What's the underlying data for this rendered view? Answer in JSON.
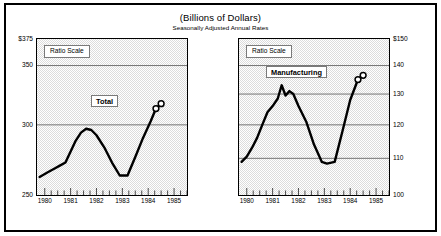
{
  "header": {
    "title": "(Billions of Dollars)",
    "subtitle": "Seasonally Adjusted Annual Rates"
  },
  "colors": {
    "frame": "#000000",
    "plot_background": "#dcdcdc",
    "gridline": "#555555",
    "series_line": "#000000",
    "label_box": "#ffffff"
  },
  "panels": {
    "left": {
      "scale_note": "Ratio Scale",
      "series_label": "Total",
      "y_ticks": [
        "$375",
        "350",
        "300",
        "250"
      ],
      "x_ticks": [
        "1980",
        "1981",
        "1982",
        "1983",
        "1984",
        "1985"
      ]
    },
    "right": {
      "scale_note": "Ratio Scale",
      "series_label": "Manufacturing",
      "y_ticks": [
        "$150",
        "140",
        "130",
        "120",
        "110",
        "100"
      ],
      "x_ticks": [
        "1980",
        "1981",
        "1982",
        "1983",
        "1984",
        "1985"
      ]
    }
  },
  "chart_data": [
    {
      "type": "line",
      "title": "(Billions of Dollars)",
      "subtitle": "Seasonally Adjusted Annual Rates",
      "name": "Total",
      "xlabel": "",
      "ylabel": "Billions of Dollars",
      "scale": "ratio (logarithmic)",
      "grid": true,
      "legend": "inline-label",
      "xlim": [
        1979.7,
        1985.5
      ],
      "ylim": [
        250,
        375
      ],
      "ytick_values": [
        375,
        350,
        300,
        250
      ],
      "ytick_labels": [
        "$375",
        "350",
        "300",
        "250"
      ],
      "xtick_values": [
        1980,
        1981,
        1982,
        1983,
        1984,
        1985
      ],
      "xtick_labels": [
        "1980",
        "1981",
        "1982",
        "1983",
        "1984",
        "1985"
      ],
      "minor_ticks": "quarterly",
      "x": [
        1979.8,
        1980.1,
        1980.4,
        1980.6,
        1980.8,
        1981.0,
        1981.2,
        1981.4,
        1981.6,
        1981.8,
        1982.0,
        1982.3,
        1982.6,
        1982.9,
        1983.2,
        1983.5,
        1983.8,
        1984.1,
        1984.3,
        1984.5
      ],
      "y": [
        262,
        265,
        268,
        270,
        272,
        280,
        288,
        294,
        297,
        296,
        292,
        283,
        272,
        263,
        263,
        276,
        290,
        303,
        313,
        317
      ],
      "preliminary_points": [
        {
          "x": 1984.3,
          "y": 313,
          "marker": "open-circle"
        },
        {
          "x": 1984.5,
          "y": 317,
          "marker": "open-circle"
        }
      ]
    },
    {
      "type": "line",
      "title": "(Billions of Dollars)",
      "subtitle": "Seasonally Adjusted Annual Rates",
      "name": "Manufacturing",
      "xlabel": "",
      "ylabel": "Billions of Dollars",
      "scale": "ratio (logarithmic)",
      "grid": true,
      "legend": "inline-label",
      "xlim": [
        1979.7,
        1985.5
      ],
      "ylim": [
        100,
        150
      ],
      "ytick_values": [
        150,
        140,
        130,
        120,
        110,
        100
      ],
      "ytick_labels": [
        "$150",
        "140",
        "130",
        "120",
        "110",
        "100"
      ],
      "xtick_values": [
        1980,
        1981,
        1982,
        1983,
        1984,
        1985
      ],
      "xtick_labels": [
        "1980",
        "1981",
        "1982",
        "1983",
        "1984",
        "1985"
      ],
      "minor_ticks": "quarterly",
      "x": [
        1979.8,
        1980.0,
        1980.2,
        1980.4,
        1980.6,
        1980.8,
        1981.0,
        1981.2,
        1981.35,
        1981.5,
        1981.65,
        1981.8,
        1982.0,
        1982.3,
        1982.6,
        1982.9,
        1983.1,
        1983.4,
        1983.7,
        1984.0,
        1984.3,
        1984.5
      ],
      "y": [
        109,
        110.5,
        113,
        116,
        120,
        124,
        126,
        128.5,
        133,
        129.5,
        131,
        130,
        126,
        121,
        114,
        109,
        108.5,
        109,
        118,
        128,
        135,
        136.5
      ],
      "preliminary_points": [
        {
          "x": 1984.3,
          "y": 135,
          "marker": "open-circle"
        },
        {
          "x": 1984.5,
          "y": 136.5,
          "marker": "open-circle"
        }
      ]
    }
  ]
}
